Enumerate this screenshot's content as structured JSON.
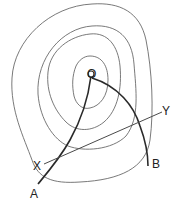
{
  "diagram": {
    "type": "contour-map",
    "labels": {
      "O": "O",
      "A": "A",
      "B": "B",
      "X": "X",
      "Y": "Y"
    },
    "contour_count": 4,
    "colors": {
      "contour": "#6a6a6a",
      "path": "#2a2a2a",
      "line": "#4a4a4a",
      "background": "#ffffff"
    }
  }
}
